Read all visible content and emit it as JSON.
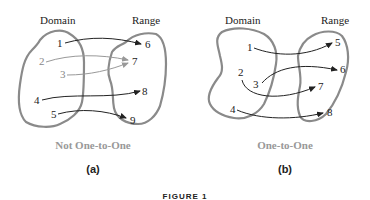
{
  "figure": {
    "caption": "FIGURE 1",
    "panels": [
      {
        "id": "a",
        "sublabel": "(a)",
        "domain_label": "Domain",
        "range_label": "Range",
        "title": "Not One-to-One",
        "domain": [
          "1",
          "2",
          "3",
          "4",
          "5"
        ],
        "range": [
          "6",
          "7",
          "8",
          "9"
        ],
        "mappings": [
          {
            "from": "1",
            "to": "6"
          },
          {
            "from": "2",
            "to": "7"
          },
          {
            "from": "3",
            "to": "7"
          },
          {
            "from": "4",
            "to": "8"
          },
          {
            "from": "5",
            "to": "9"
          }
        ]
      },
      {
        "id": "b",
        "sublabel": "(b)",
        "domain_label": "Domain",
        "range_label": "Range",
        "title": "One-to-One",
        "domain": [
          "1",
          "2",
          "3",
          "4"
        ],
        "range": [
          "5",
          "6",
          "7",
          "8"
        ],
        "mappings": [
          {
            "from": "1",
            "to": "5"
          },
          {
            "from": "3",
            "to": "6"
          },
          {
            "from": "2",
            "to": "7"
          },
          {
            "from": "4",
            "to": "8"
          }
        ]
      }
    ],
    "colors": {
      "outline": "#8a8a8a",
      "arrow": "#222222",
      "highlight_arrow": "#999999",
      "title": "#999999"
    }
  }
}
